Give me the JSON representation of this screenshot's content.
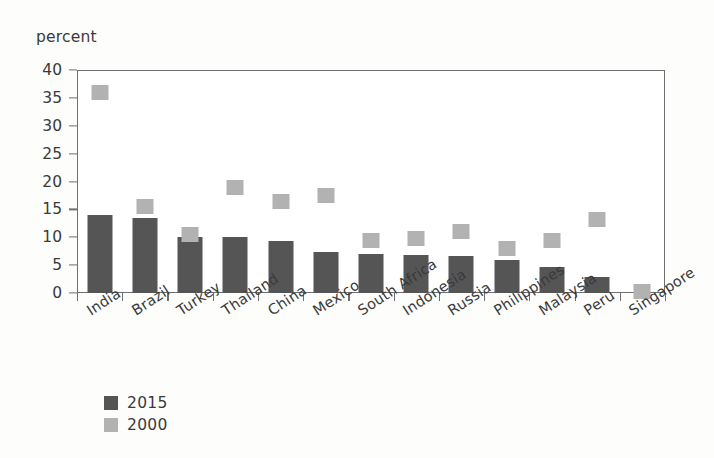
{
  "chart_data": {
    "type": "bar",
    "title": "",
    "subtitle": "",
    "xlabel": "",
    "ylabel": "percent",
    "ylim": [
      0,
      40
    ],
    "yticks": [
      40,
      35,
      30,
      25,
      20,
      15,
      10,
      5,
      0
    ],
    "grid": false,
    "legend_position": "bottom-left",
    "categories": [
      "India",
      "Brazil",
      "Turkey",
      "Thailand",
      "China",
      "Mexico",
      "South Africa",
      "Indonesia",
      "Russia",
      "Philippines",
      "Malaysia",
      "Peru",
      "Singapore"
    ],
    "series": [
      {
        "name": "2015",
        "render": "bar",
        "color": "#555555",
        "values": [
          14.0,
          13.5,
          10.0,
          10.0,
          9.4,
          7.4,
          7.0,
          6.8,
          6.6,
          6.0,
          4.7,
          2.9,
          0.0
        ]
      },
      {
        "name": "2000",
        "render": "marker",
        "color": "#b2b2b2",
        "values": [
          36.0,
          15.5,
          10.5,
          19.0,
          16.5,
          17.5,
          9.5,
          9.7,
          11.0,
          8.0,
          9.5,
          13.2,
          0.3
        ]
      }
    ]
  },
  "legend": {
    "items": [
      {
        "label": "2015",
        "color": "#555555"
      },
      {
        "label": "2000",
        "color": "#b2b2b2"
      }
    ]
  },
  "colors": {
    "bar_2015": "#555555",
    "marker_2000": "#b2b2b2",
    "axis": "#6f6f6f",
    "text": "#3a3a3a",
    "background": "#fdfdfc",
    "plot_background": "#ffffff"
  }
}
